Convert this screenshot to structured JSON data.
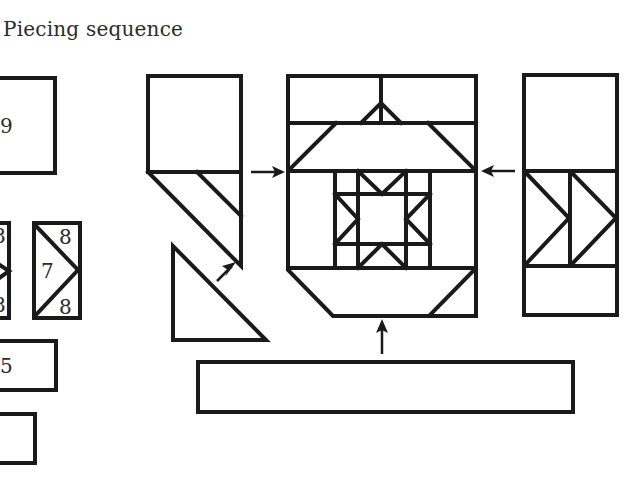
{
  "title": "Piecing sequence",
  "pieces": {
    "piece_9_label": "9",
    "unit_7_center_label": "7",
    "unit_7_top_label": "8",
    "unit_7_bottom_label": "8",
    "partial_unit_top_label": "8",
    "partial_unit_bottom_label": "8",
    "piece_5_label": "5"
  },
  "arrows": [
    {
      "id": "left-column-to-center",
      "direction": "right"
    },
    {
      "id": "triangle-to-left-column",
      "direction": "up-right"
    },
    {
      "id": "right-column-to-center",
      "direction": "left"
    },
    {
      "id": "bottom-strip-to-center",
      "direction": "up"
    }
  ],
  "colors": {
    "line": "#1a1a1a",
    "background": "#ffffff",
    "text": "#2b2b2b"
  }
}
